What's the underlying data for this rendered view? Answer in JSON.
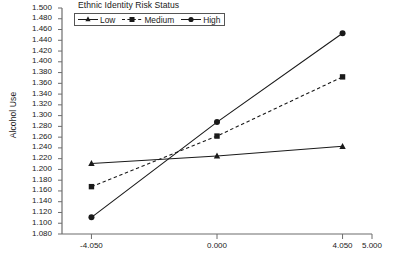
{
  "chart_data": {
    "type": "line",
    "title": "Ethnic Identity Risk Status",
    "xlabel": "",
    "ylabel": "Alcohol Use",
    "x": [
      -4.05,
      0.0,
      4.05
    ],
    "xlim": [
      -5.0,
      5.0
    ],
    "ylim": [
      1.08,
      1.5
    ],
    "y_tick_step": 0.02,
    "grid": false,
    "legend_position": "top-center",
    "x_tick_labels": [
      "-4.050",
      "0.000",
      "4.050",
      "5.000"
    ],
    "x_tick_values": [
      -4.05,
      0.0,
      4.05,
      5.0
    ],
    "y_tick_labels": [
      "1.500",
      "1.480",
      "1.460",
      "1.440",
      "1.420",
      "1.400",
      "1.380",
      "1.360",
      "1.340",
      "1.320",
      "1.300",
      "1.280",
      "1.260",
      "1.240",
      "1.220",
      "1.200",
      "1.180",
      "1.160",
      "1.140",
      "1.120",
      "1.100",
      "1.080"
    ],
    "y_tick_values": [
      1.5,
      1.48,
      1.46,
      1.44,
      1.42,
      1.4,
      1.38,
      1.36,
      1.34,
      1.32,
      1.3,
      1.28,
      1.26,
      1.24,
      1.22,
      1.2,
      1.18,
      1.16,
      1.14,
      1.12,
      1.1,
      1.08
    ],
    "series": [
      {
        "name": "Low",
        "marker": "triangle",
        "line_style": "solid",
        "color": "#1a1a1a",
        "values": [
          1.211,
          1.225,
          1.243
        ]
      },
      {
        "name": "Medium",
        "marker": "square",
        "line_style": "dashed",
        "color": "#1a1a1a",
        "values": [
          1.168,
          1.262,
          1.372
        ]
      },
      {
        "name": "High",
        "marker": "circle",
        "line_style": "solid",
        "color": "#1a1a1a",
        "values": [
          1.111,
          1.288,
          1.453
        ]
      }
    ]
  },
  "legend": {
    "entries": [
      {
        "label": "Low"
      },
      {
        "label": "Medium"
      },
      {
        "label": "High"
      }
    ]
  }
}
